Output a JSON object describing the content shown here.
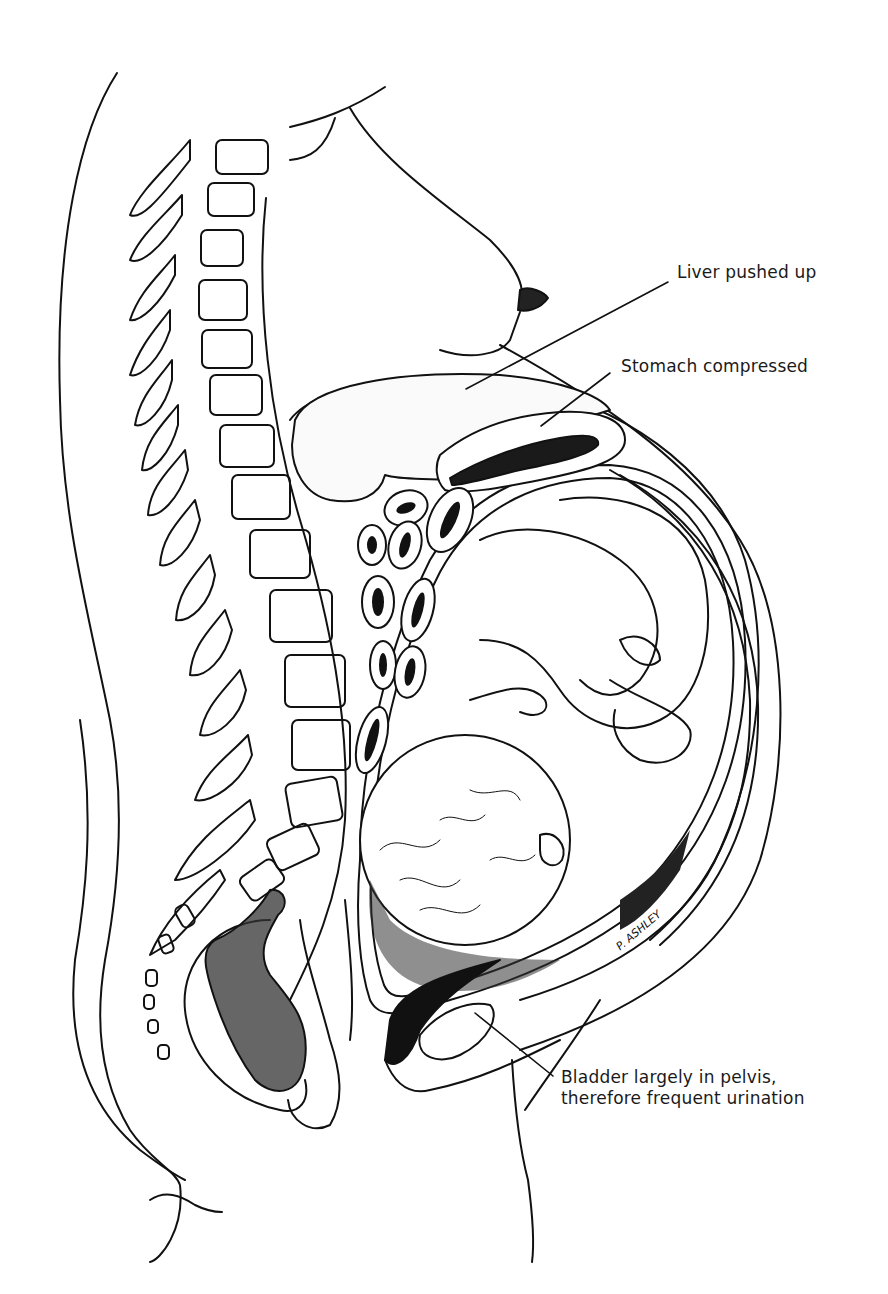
{
  "figure": {
    "colors": {
      "line": "#111111",
      "background": "#ffffff",
      "shading": "#1a1a1a"
    }
  },
  "labels": {
    "liver": "Liver pushed up",
    "stomach": "Stomach compressed",
    "bladder_line1": "Bladder largely in pelvis,",
    "bladder_line2": "therefore frequent urination"
  },
  "signature": "P. ASHLEY"
}
